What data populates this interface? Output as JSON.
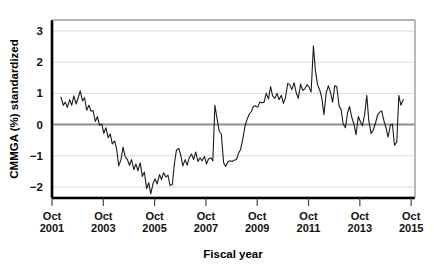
{
  "chart_data": {
    "type": "line",
    "title": "",
    "xlabel": "Fiscal year",
    "ylabel": "CMMGA (%) standardized",
    "ylim": [
      -2.35,
      3.35
    ],
    "xlim": [
      2001.75,
      2015.9
    ],
    "grid": true,
    "legend": "none",
    "yticks": [
      3,
      2,
      1,
      0,
      -1,
      -2
    ],
    "ytick_labels": [
      "3",
      "2",
      "1",
      "0",
      "−1",
      "−2"
    ],
    "xticks": [
      2001.75,
      2003.75,
      2005.75,
      2007.75,
      2009.75,
      2011.75,
      2013.75,
      2015.75
    ],
    "xtick_labels": [
      {
        "month": "Oct",
        "year": "2001"
      },
      {
        "month": "Oct",
        "year": "2003"
      },
      {
        "month": "Oct",
        "year": "2005"
      },
      {
        "month": "Oct",
        "year": "2007"
      },
      {
        "month": "Oct",
        "year": "2009"
      },
      {
        "month": "Oct",
        "year": "2011"
      },
      {
        "month": "Oct",
        "year": "2013"
      },
      {
        "month": "Oct",
        "year": "2015"
      }
    ],
    "zero_line": 0,
    "line_color": "#1a1a1a",
    "grid_color": "#d9d9d9",
    "zero_line_color": "#8c8c8c",
    "frame_color": "#000000",
    "series": [
      {
        "name": "CMMGA (%) standardized",
        "x": [
          2002.1,
          2002.19,
          2002.27,
          2002.35,
          2002.44,
          2002.52,
          2002.6,
          2002.69,
          2002.77,
          2002.85,
          2002.94,
          2003.02,
          2003.1,
          2003.19,
          2003.27,
          2003.35,
          2003.44,
          2003.52,
          2003.6,
          2003.69,
          2003.77,
          2003.85,
          2003.94,
          2004.02,
          2004.1,
          2004.19,
          2004.27,
          2004.35,
          2004.44,
          2004.52,
          2004.6,
          2004.69,
          2004.77,
          2004.85,
          2004.94,
          2005.02,
          2005.1,
          2005.19,
          2005.27,
          2005.35,
          2005.44,
          2005.52,
          2005.6,
          2005.69,
          2005.77,
          2005.85,
          2005.94,
          2006.02,
          2006.1,
          2006.19,
          2006.27,
          2006.35,
          2006.44,
          2006.52,
          2006.6,
          2006.69,
          2006.77,
          2006.85,
          2006.94,
          2007.02,
          2007.1,
          2007.19,
          2007.27,
          2007.35,
          2007.44,
          2007.52,
          2007.6,
          2007.69,
          2007.77,
          2007.85,
          2007.94,
          2008.02,
          2008.1,
          2008.19,
          2008.27,
          2008.35,
          2008.44,
          2008.52,
          2008.6,
          2008.69,
          2008.77,
          2008.85,
          2008.94,
          2009.02,
          2009.1,
          2009.19,
          2009.27,
          2009.35,
          2009.44,
          2009.52,
          2009.6,
          2009.69,
          2009.77,
          2009.85,
          2009.94,
          2010.02,
          2010.1,
          2010.19,
          2010.27,
          2010.35,
          2010.44,
          2010.52,
          2010.6,
          2010.69,
          2010.77,
          2010.85,
          2010.94,
          2011.02,
          2011.1,
          2011.19,
          2011.27,
          2011.35,
          2011.44,
          2011.52,
          2011.6,
          2011.69,
          2011.77,
          2011.85,
          2011.94,
          2012.02,
          2012.1,
          2012.19,
          2012.27,
          2012.35,
          2012.44,
          2012.52,
          2012.6,
          2012.69,
          2012.77,
          2012.85,
          2012.94,
          2013.02,
          2013.1,
          2013.19,
          2013.27,
          2013.35,
          2013.44,
          2013.52,
          2013.6,
          2013.69,
          2013.77,
          2013.85,
          2013.94,
          2014.02,
          2014.1,
          2014.19,
          2014.27,
          2014.35,
          2014.44,
          2014.52,
          2014.6,
          2014.69,
          2014.77,
          2014.85,
          2014.94,
          2015.02,
          2015.1,
          2015.19,
          2015.27,
          2015.35,
          2015.44
        ],
        "y": [
          0.88,
          0.62,
          0.72,
          0.55,
          0.8,
          0.62,
          0.92,
          0.66,
          0.86,
          1.08,
          0.76,
          0.86,
          0.46,
          0.62,
          0.43,
          0.45,
          0.1,
          0.26,
          -0.02,
          0.02,
          -0.28,
          -0.1,
          -0.42,
          -0.3,
          -0.62,
          -0.52,
          -0.78,
          -1.32,
          -1.12,
          -0.72,
          -1.02,
          -1.12,
          -1.3,
          -1.12,
          -1.44,
          -1.26,
          -1.48,
          -1.22,
          -1.66,
          -1.52,
          -2.05,
          -1.86,
          -2.22,
          -1.88,
          -1.74,
          -1.9,
          -1.6,
          -1.76,
          -1.54,
          -1.68,
          -1.62,
          -1.95,
          -1.92,
          -1.26,
          -0.82,
          -0.76,
          -0.98,
          -1.32,
          -1.12,
          -1.3,
          -1.06,
          -0.94,
          -1.12,
          -0.88,
          -1.18,
          -1.06,
          -1.16,
          -1.02,
          -1.26,
          -1.1,
          -1.06,
          -1.16,
          0.62,
          0.16,
          -0.22,
          -0.3,
          -1.22,
          -1.34,
          -1.2,
          -1.16,
          -1.18,
          -1.14,
          -1.12,
          -0.92,
          -0.8,
          -0.45,
          -0.06,
          0.16,
          0.34,
          0.42,
          0.58,
          0.6,
          0.56,
          0.72,
          0.7,
          0.72,
          1.0,
          0.82,
          1.22,
          0.92,
          0.84,
          1.0,
          0.8,
          0.94,
          0.68,
          0.86,
          1.32,
          1.28,
          1.12,
          1.34,
          1.02,
          0.84,
          1.3,
          1.1,
          1.14,
          1.28,
          1.2,
          1.04,
          2.52,
          1.72,
          1.28,
          1.1,
          0.84,
          0.32,
          1.02,
          1.24,
          1.06,
          0.72,
          1.24,
          1.22,
          0.6,
          0.48,
          0.02,
          -0.1,
          0.38,
          0.58,
          0.22,
          0.02,
          -0.32,
          0.26,
          0.1,
          -0.04,
          0.34,
          0.94,
          0.12,
          -0.28,
          -0.18,
          0.02,
          0.3,
          0.4,
          0.44,
          0.12,
          -0.1,
          -0.4,
          -0.02,
          0.02,
          -0.66,
          -0.56,
          0.94,
          0.62,
          0.8
        ]
      }
    ]
  }
}
